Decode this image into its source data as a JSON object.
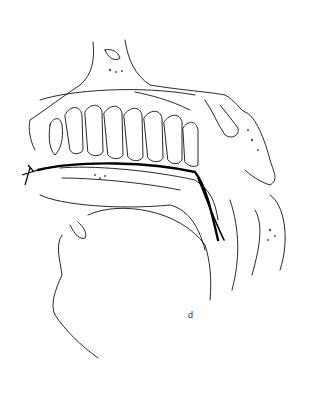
{
  "figure": {
    "labels": [
      {
        "id": "d",
        "text": "d"
      }
    ]
  }
}
